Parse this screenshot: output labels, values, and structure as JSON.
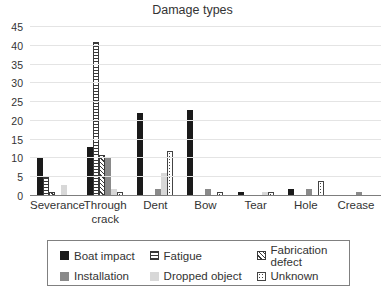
{
  "chart_data": {
    "type": "bar",
    "title": "Damage types",
    "xlabel": "",
    "ylabel": "",
    "ylim": [
      0,
      45
    ],
    "ytick_step": 5,
    "yticks": [
      0,
      5,
      10,
      15,
      20,
      25,
      30,
      35,
      40,
      45
    ],
    "grid": true,
    "legend_position": "bottom",
    "categories": [
      "Severance",
      "Through crack",
      "Dent",
      "Bow",
      "Tear",
      "Hole",
      "Crease"
    ],
    "series": [
      {
        "name": "Boat impact",
        "style": "solid-black",
        "color": "#1a1a1a",
        "values": [
          10,
          13,
          22,
          23,
          1,
          2,
          0
        ]
      },
      {
        "name": "Fatigue",
        "style": "horizontal-stripes",
        "color": "#3a3a3a",
        "values": [
          5,
          41,
          0,
          0,
          0,
          0,
          0
        ]
      },
      {
        "name": "Fabrication defect",
        "style": "diagonal-hatch",
        "color": "#3a3a3a",
        "values": [
          1,
          11,
          0,
          0,
          0,
          0,
          0
        ]
      },
      {
        "name": "Installation",
        "style": "solid-darkgray",
        "color": "#8a8a8a",
        "values": [
          0,
          10,
          2,
          2,
          0,
          2,
          1
        ]
      },
      {
        "name": "Dropped object",
        "style": "solid-lightgray",
        "color": "#d8d8d8",
        "values": [
          3,
          2,
          6,
          0,
          1,
          0,
          0
        ]
      },
      {
        "name": "Unknown",
        "style": "dots",
        "color": "#444444",
        "values": [
          0,
          1,
          12,
          1,
          1,
          4,
          0
        ]
      }
    ]
  }
}
